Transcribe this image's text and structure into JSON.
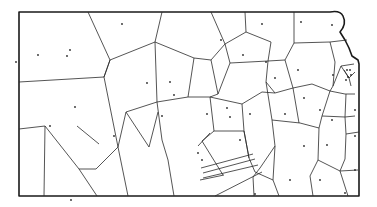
{
  "diagram": {
    "type": "voronoi-map",
    "width": 377,
    "height": 207,
    "colors": {
      "background": "#ffffff",
      "line": "#2a2a2a",
      "border": "#1a1a1a",
      "site": "#2a2a2a"
    },
    "border": "M19,12 L330,12 Q340,10 343,16 Q347,24 340,32 L345,40 L349,48 L352,56 L358,60 L359,64 L359,196 L19,196 Z",
    "edges": [
      "M88,12 L110,60 L104,77 L118,147 L96,169 L79,169 L45,126 L19,129",
      "M19,82 L104,77",
      "M110,60 L155,42 L162,12",
      "M155,42 L157,102 L126,112 L118,147",
      "M126,112 L149,147 L158,112",
      "M157,102 L188,97 L194,58 L155,42",
      "M194,58 L211,60 L225,44 L211,12",
      "M211,60 L218,94 L210,97",
      "M188,97 L210,97 L214,131 L202,141 L223,175",
      "M210,97 L242,104 L244,131",
      "M214,131 L244,131 L249,158",
      "M225,44 L246,32 L245,12",
      "M246,32 L271,42 L268,61",
      "M225,44 L230,63 L218,94",
      "M230,63 L268,61 L285,60",
      "M268,61 L266,82 L275,93",
      "M242,104 L262,92 L275,93 L293,88",
      "M285,60 L294,43 L294,12",
      "M294,43 L330,42 L347,40",
      "M285,60 L293,88 L312,84 L330,91 L333,86 L335,62 L330,42",
      "M330,91 L345,94 L355,94",
      "M333,86 L341,66 L354,64",
      "M344,70 L349,78 L355,72",
      "M341,66 L349,78 L351,86",
      "M293,88 L299,123",
      "M266,82 L272,120 L300,123 L319,128",
      "M319,128 L322,116 L330,91",
      "M322,116 L345,117 L355,116",
      "M345,117 L346,94",
      "M319,128 L318,160 L340,171 L358,170",
      "M340,171 L345,159 L346,134 L359,132",
      "M346,134 L345,117",
      "M272,120 L275,146 L260,168 L253,177 L254,196",
      "M249,158 L255,172 L273,180 L275,146",
      "M244,131 L249,158",
      "M273,180 L279,196",
      "M318,160 L310,176 L313,196",
      "M340,171 L348,196",
      "M99,144 L77,126",
      "M110,60 L104,77",
      "M198,146 L210,133",
      "M224,175 L200,180",
      "M201,168 L253,154",
      "M203,173 L255,159",
      "M203,178 L258,165",
      "M215,196 L262,172",
      "M157,102 L162,140 L168,160",
      "M168,160 L174,196",
      "M118,147 L128,196",
      "M45,126 L44,196",
      "M79,169 L97,196"
    ],
    "sites": [
      [
        70,
        50
      ],
      [
        122,
        24
      ],
      [
        147,
        83
      ],
      [
        170,
        82
      ],
      [
        16,
        62
      ],
      [
        38,
        55
      ],
      [
        67,
        56
      ],
      [
        221,
        40
      ],
      [
        243,
        55
      ],
      [
        266,
        62
      ],
      [
        275,
        78
      ],
      [
        301,
        22
      ],
      [
        262,
        24
      ],
      [
        298,
        70
      ],
      [
        332,
        25
      ],
      [
        333,
        75
      ],
      [
        347,
        70
      ],
      [
        350,
        70
      ],
      [
        348,
        77
      ],
      [
        351,
        75
      ],
      [
        346,
        80
      ],
      [
        75,
        107
      ],
      [
        50,
        126
      ],
      [
        114,
        136
      ],
      [
        162,
        116
      ],
      [
        174,
        95
      ],
      [
        207,
        114
      ],
      [
        227,
        108
      ],
      [
        250,
        114
      ],
      [
        304,
        98
      ],
      [
        285,
        114
      ],
      [
        320,
        110
      ],
      [
        355,
        110
      ],
      [
        198,
        153
      ],
      [
        202,
        160
      ],
      [
        230,
        117
      ],
      [
        240,
        140
      ],
      [
        332,
        120
      ],
      [
        355,
        136
      ],
      [
        304,
        146
      ],
      [
        327,
        145
      ],
      [
        355,
        170
      ],
      [
        255,
        194
      ],
      [
        345,
        193
      ],
      [
        290,
        180
      ],
      [
        320,
        180
      ],
      [
        71,
        200
      ]
    ]
  }
}
